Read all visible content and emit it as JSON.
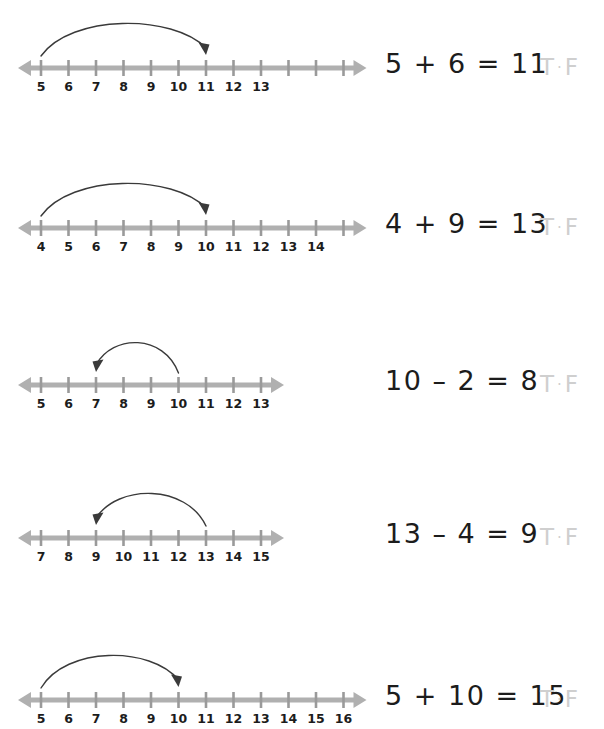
{
  "page": {
    "background_color": "#ffffff",
    "line_color": "#b0b0b0",
    "tick_color": "#9a9a9a",
    "arrow_color": "#3a3a3a",
    "equation_color": "#1c1c1c",
    "answer_color": "#cfcfcf"
  },
  "answer_options": {
    "true_label": "T",
    "separator": "·",
    "false_label": "F"
  },
  "problems": [
    {
      "id": "problem-1",
      "equation": "5 + 6 = 11",
      "operation": "addition",
      "jump_from": 5,
      "jump_to": 11,
      "jump_direction": "right",
      "line_start": 5,
      "line_end": 16,
      "tick_values": [
        5,
        6,
        7,
        8,
        9,
        10,
        11,
        12,
        13,
        14,
        15,
        16
      ],
      "tick_labels": [
        "5",
        "6",
        "7",
        "8",
        "9",
        "10",
        "11",
        "12",
        "13",
        "",
        "",
        ""
      ],
      "answer": {
        "true_label": "T",
        "separator": "·",
        "false_label": "F"
      }
    },
    {
      "id": "problem-2",
      "equation": "4 + 9 = 13",
      "operation": "addition",
      "jump_from": 4,
      "jump_to": 10,
      "jump_direction": "right",
      "line_start": 4,
      "line_end": 15,
      "tick_values": [
        4,
        5,
        6,
        7,
        8,
        9,
        10,
        11,
        12,
        13,
        14,
        15
      ],
      "tick_labels": [
        "4",
        "5",
        "6",
        "7",
        "8",
        "9",
        "10",
        "11",
        "12",
        "13",
        "14",
        ""
      ],
      "answer": {
        "true_label": "T",
        "separator": "·",
        "false_label": "F"
      }
    },
    {
      "id": "problem-3",
      "equation": "10 – 2 = 8",
      "operation": "subtraction",
      "jump_from": 10,
      "jump_to": 7,
      "jump_direction": "left",
      "line_start": 5,
      "line_end": 13,
      "tick_values": [
        5,
        6,
        7,
        8,
        9,
        10,
        11,
        12,
        13
      ],
      "tick_labels": [
        "5",
        "6",
        "7",
        "8",
        "9",
        "10",
        "11",
        "12",
        "13"
      ],
      "answer": {
        "true_label": "T",
        "separator": "·",
        "false_label": "F"
      }
    },
    {
      "id": "problem-4",
      "equation": "13 – 4 = 9",
      "operation": "subtraction",
      "jump_from": 13,
      "jump_to": 9,
      "jump_direction": "left",
      "line_start": 7,
      "line_end": 15,
      "tick_values": [
        7,
        8,
        9,
        10,
        11,
        12,
        13,
        14,
        15
      ],
      "tick_labels": [
        "7",
        "8",
        "9",
        "10",
        "11",
        "12",
        "13",
        "14",
        "15"
      ],
      "answer": {
        "true_label": "T",
        "separator": "·",
        "false_label": "F"
      }
    },
    {
      "id": "problem-5",
      "equation": "5 + 10 = 15",
      "operation": "addition",
      "jump_from": 5,
      "jump_to": 10,
      "jump_direction": "right",
      "line_start": 5,
      "line_end": 16,
      "tick_values": [
        5,
        6,
        7,
        8,
        9,
        10,
        11,
        12,
        13,
        14,
        15,
        16
      ],
      "tick_labels": [
        "5",
        "6",
        "7",
        "8",
        "9",
        "10",
        "11",
        "12",
        "13",
        "14",
        "15",
        "16"
      ],
      "answer": {
        "true_label": "T",
        "separator": "·",
        "false_label": "F"
      }
    }
  ],
  "layout": {
    "row_tops": [
      8,
      168,
      325,
      478,
      640
    ],
    "equation_left": 385,
    "answer_left": 540,
    "text_top": 42,
    "axis_y": 60,
    "first_tick_x": 41,
    "tick_spacing": 27.5
  }
}
